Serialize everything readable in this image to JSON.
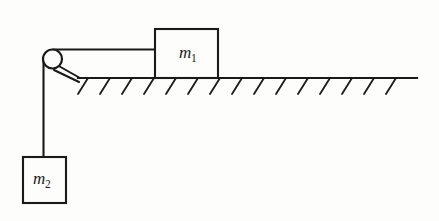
{
  "figure": {
    "background_color": "#fdfdfc",
    "ink_color": "#1a1a1a",
    "width": 439,
    "height": 221
  },
  "blocks": [
    {
      "id": "block-m1",
      "label_base": "m",
      "label_sub": "1",
      "label_full": "m1",
      "x": 155,
      "y": 29,
      "width": 63,
      "height": 49,
      "label_x": 179,
      "label_y": 58,
      "sub_x": 190,
      "sub_y": 62
    },
    {
      "id": "block-m2",
      "label_base": "m",
      "label_sub": "2",
      "label_full": "m2",
      "x": 23,
      "y": 157,
      "width": 43,
      "height": 46,
      "label_x": 34,
      "label_y": 183,
      "sub_x": 45,
      "sub_y": 187
    }
  ],
  "pulley": {
    "id": "pulley",
    "center_x": 52.5,
    "center_y": 59,
    "radius": 9.5
  },
  "ropes": {
    "horizontal_segment": {
      "x1": 52.5,
      "y1": 49.5,
      "x2": 155,
      "y2": 49.5
    },
    "vertical_segment": {
      "x1": 43.5,
      "y1": 59,
      "x2": 43.5,
      "y2": 157
    }
  },
  "bracket": {
    "line_a": {
      "x1": 57,
      "y1": 65,
      "x2": 80,
      "y2": 78
    },
    "line_b": {
      "x1": 54,
      "y1": 70,
      "x2": 79,
      "y2": 82
    }
  },
  "ground": {
    "line": {
      "x1": 78,
      "y1": 78,
      "x2": 417,
      "y2": 78
    },
    "hatch_count": 15,
    "hatch_start_x": 88,
    "hatch_spacing": 22,
    "hatch_dx": -10,
    "hatch_dy": 16
  }
}
